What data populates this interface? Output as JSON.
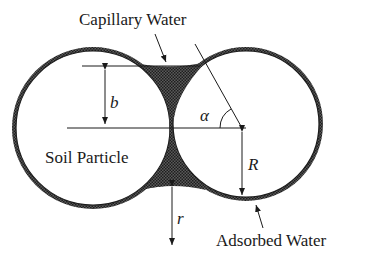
{
  "diagram": {
    "labels": {
      "capillary_water": "Capillary Water",
      "soil_particle": "Soil Particle",
      "adsorbed_water": "Adsorbed Water",
      "b": "b",
      "alpha": "α",
      "R": "R",
      "r": "r"
    },
    "elements": [
      {
        "id": "left-particle",
        "shape": "circle",
        "cx": 93,
        "cy": 128,
        "r": 78
      },
      {
        "id": "right-particle",
        "shape": "circle",
        "cx": 246,
        "cy": 124,
        "r": 74
      },
      {
        "id": "capillary-meniscus",
        "shape": "region",
        "fill": "hatched-dark"
      }
    ],
    "colors": {
      "ink": "#1a1a1a",
      "water": "#3a3a3a",
      "background": "#ffffff"
    }
  }
}
